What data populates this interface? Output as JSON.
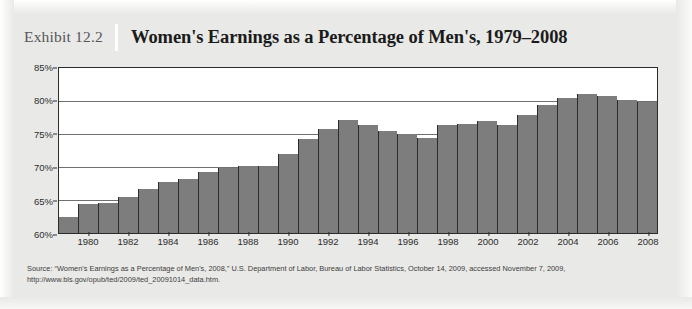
{
  "exhibit": {
    "number": "Exhibit 12.2",
    "title": "Women's Earnings as a Percentage of Men's, 1979–2008"
  },
  "source_note": "Source: “Women's Earnings as a Percentage of Men's, 2008,” U.S. Department of Labor, Bureau of Labor Statistics, October 14, 2009, accessed November 7, 2009, http://www.bls.gov/opub/ted/2009/ted_20091014_data.htm.",
  "colors": {
    "bar_fill": "#7d7d7d",
    "bar_outline": "#2b2b2b",
    "gridline": "#6f6f6f",
    "plot_background": "#ffffff",
    "page_background": "#e9e9e7"
  },
  "chart_data": {
    "type": "bar",
    "title": "Women's Earnings as a Percentage of Men's, 1979–2008",
    "xlabel": "",
    "ylabel": "",
    "ylim": [
      60,
      85
    ],
    "ytick_values": [
      60,
      65,
      70,
      75,
      80,
      85
    ],
    "ytick_labels": [
      "60%",
      "65%",
      "70%",
      "75%",
      "80%",
      "85%"
    ],
    "grid": true,
    "legend": "none",
    "xtick_labels": [
      "1980",
      "1982",
      "1984",
      "1986",
      "1988",
      "1990",
      "1992",
      "1994",
      "1996",
      "1998",
      "2000",
      "2002",
      "2004",
      "2006",
      "2008"
    ],
    "categories": [
      "1979",
      "1980",
      "1981",
      "1982",
      "1983",
      "1984",
      "1985",
      "1986",
      "1987",
      "1988",
      "1989",
      "1990",
      "1991",
      "1992",
      "1993",
      "1994",
      "1995",
      "1996",
      "1997",
      "1998",
      "1999",
      "2000",
      "2001",
      "2002",
      "2003",
      "2004",
      "2005",
      "2006",
      "2007",
      "2008"
    ],
    "values": [
      62.5,
      64.4,
      64.6,
      65.4,
      66.7,
      67.8,
      68.2,
      69.2,
      69.8,
      70.2,
      70.1,
      71.9,
      74.2,
      75.8,
      77.1,
      76.4,
      75.5,
      75.0,
      74.4,
      76.3,
      76.5,
      76.9,
      76.4,
      77.9,
      79.4,
      80.4,
      81.0,
      80.8,
      80.2,
      79.9
    ],
    "units": "percent of men's earnings",
    "series_name": "Women's earnings as a percentage of men's"
  }
}
